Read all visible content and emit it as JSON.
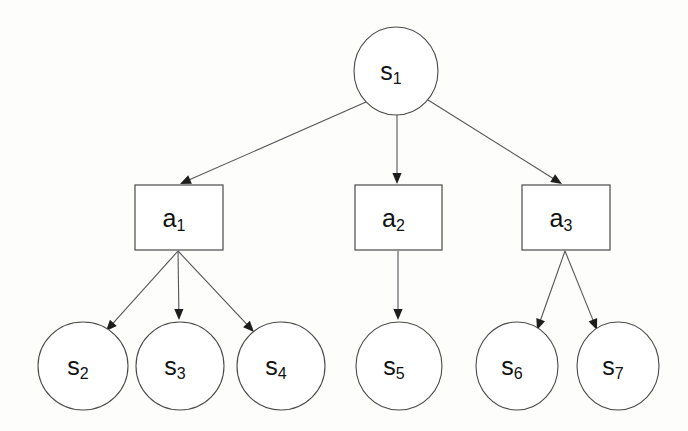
{
  "diagram": {
    "type": "tree",
    "background_color": "#fdfdfb",
    "node_stroke_color": "#4a4a4a",
    "edge_color": "#55555a",
    "arrowhead_color": "#1d1d1d",
    "label_color": "#111111",
    "state_nodes": [
      {
        "id": "s1",
        "base": "s",
        "subscript": "1",
        "label": "s1",
        "shape": "ellipse",
        "cx": 396,
        "cy": 71,
        "rx": 42,
        "ry": 44
      },
      {
        "id": "s2",
        "base": "s",
        "subscript": "2",
        "label": "s2",
        "shape": "ellipse",
        "cx": 83,
        "cy": 366,
        "rx": 45,
        "ry": 44
      },
      {
        "id": "s3",
        "base": "s",
        "subscript": "3",
        "label": "s3",
        "shape": "ellipse",
        "cx": 180,
        "cy": 366,
        "rx": 44,
        "ry": 44
      },
      {
        "id": "s4",
        "base": "s",
        "subscript": "4",
        "label": "s4",
        "shape": "ellipse",
        "cx": 281,
        "cy": 366,
        "rx": 44,
        "ry": 44
      },
      {
        "id": "s5",
        "base": "s",
        "subscript": "5",
        "label": "s5",
        "shape": "ellipse",
        "cx": 399,
        "cy": 366,
        "rx": 43,
        "ry": 44
      },
      {
        "id": "s6",
        "base": "s",
        "subscript": "6",
        "label": "s6",
        "shape": "ellipse",
        "cx": 517,
        "cy": 366,
        "rx": 41,
        "ry": 44
      },
      {
        "id": "s7",
        "base": "s",
        "subscript": "7",
        "label": "s7",
        "shape": "ellipse",
        "cx": 618,
        "cy": 366,
        "rx": 41,
        "ry": 44
      }
    ],
    "action_nodes": [
      {
        "id": "a1",
        "base": "a",
        "subscript": "1",
        "label": "a1",
        "shape": "rect",
        "x": 135,
        "y": 185,
        "w": 88,
        "h": 65
      },
      {
        "id": "a2",
        "base": "a",
        "subscript": "2",
        "label": "a2",
        "shape": "rect",
        "x": 355,
        "y": 185,
        "w": 87,
        "h": 65
      },
      {
        "id": "a3",
        "base": "a",
        "subscript": "3",
        "label": "a3",
        "shape": "rect",
        "x": 522,
        "y": 185,
        "w": 88,
        "h": 65
      }
    ],
    "edges": [
      {
        "id": "e-s1-a1",
        "from": "s1",
        "to": "a1",
        "x1": 366,
        "y1": 102,
        "x2": 180,
        "y2": 184
      },
      {
        "id": "e-s1-a2",
        "from": "s1",
        "to": "a2",
        "x1": 397,
        "y1": 115,
        "x2": 397,
        "y2": 184
      },
      {
        "id": "e-s1-a3",
        "from": "s1",
        "to": "a3",
        "x1": 428,
        "y1": 100,
        "x2": 562,
        "y2": 184
      },
      {
        "id": "e-a1-s2",
        "from": "a1",
        "to": "s2",
        "x1": 178,
        "y1": 251,
        "x2": 106,
        "y2": 331
      },
      {
        "id": "e-a1-s3",
        "from": "a1",
        "to": "s3",
        "x1": 178,
        "y1": 251,
        "x2": 179,
        "y2": 320
      },
      {
        "id": "e-a1-s4",
        "from": "a1",
        "to": "s4",
        "x1": 178,
        "y1": 251,
        "x2": 254,
        "y2": 332
      },
      {
        "id": "e-a2-s5",
        "from": "a2",
        "to": "s5",
        "x1": 398,
        "y1": 251,
        "x2": 398,
        "y2": 320
      },
      {
        "id": "e-a3-s6",
        "from": "a3",
        "to": "s6",
        "x1": 565,
        "y1": 251,
        "x2": 537,
        "y2": 330
      },
      {
        "id": "e-a3-s7",
        "from": "a3",
        "to": "s7",
        "x1": 565,
        "y1": 251,
        "x2": 597,
        "y2": 330
      }
    ]
  }
}
